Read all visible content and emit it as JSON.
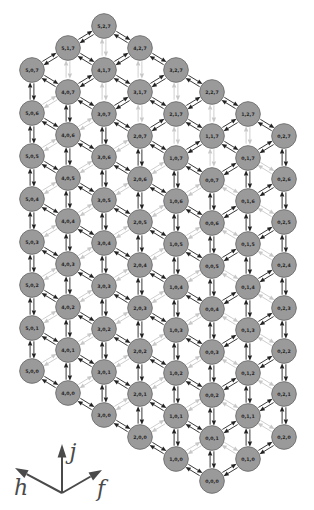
{
  "figure": {
    "type": "3d-lattice-graph",
    "background": "#ffffff",
    "colors": {
      "node_fill": "#9a9a9a",
      "node_border": "#747474",
      "node_label": "#262626",
      "edge_dark": "#222222",
      "edge_faint": "#c8c8c8",
      "legend": "#4a4a4a"
    },
    "legend": {
      "axis_up_label": "j",
      "axis_left_label": "h",
      "axis_right_label": "f"
    },
    "node_labels": [
      "5,2,7",
      "5,1,7",
      "5,0,7",
      "4,2,7",
      "4,1,7",
      "4,0,7",
      "3,2,7",
      "3,1,7",
      "3,0,7",
      "2,2,7",
      "2,1,7",
      "2,0,7",
      "1,2,7",
      "1,1,7",
      "1,0,7",
      "0,2,7",
      "0,1,7",
      "0,0,7",
      "5,0,6",
      "5,0,5",
      "5,0,4",
      "5,0,3",
      "5,0,2",
      "5,0,1",
      "5,0,0",
      "4,0,6",
      "4,0,5",
      "4,0,4",
      "4,0,3",
      "4,0,2",
      "4,0,1",
      "4,0,0",
      "3,0,6",
      "3,0,5",
      "3,0,4",
      "3,0,3",
      "3,0,2",
      "3,0,1",
      "3,0,0",
      "2,0,6",
      "2,0,5",
      "2,0,4",
      "2,0,3",
      "2,0,2",
      "2,0,1",
      "2,0,0",
      "1,0,6",
      "1,0,5",
      "1,0,4",
      "1,0,3",
      "1,0,2",
      "1,0,1",
      "1,0,0",
      "0,0,6",
      "0,0,5",
      "0,0,4",
      "0,0,3",
      "0,0,2",
      "0,0,1",
      "0,0,0",
      "0,1,6",
      "0,1,5",
      "0,1,4",
      "0,1,3",
      "0,1,2",
      "0,1,1",
      "0,1,0",
      "0,2,6",
      "0,2,5",
      "0,2,4",
      "0,2,3",
      "0,2,2",
      "0,2,1",
      "0,2,0"
    ]
  }
}
